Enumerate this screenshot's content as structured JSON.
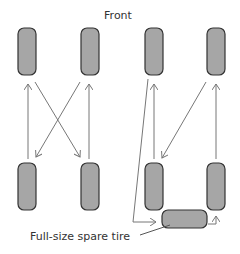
{
  "title": "Front",
  "spare_label": "Full-size spare tire",
  "colors": {
    "tire_fill": "#a6a6a6",
    "tire_stroke": "#333333",
    "arrow": "#777777",
    "text": "#333333"
  },
  "diagrams": [
    {
      "name": "four-tire-cross-rotation",
      "tires": [
        "front-left",
        "front-right",
        "rear-left",
        "rear-right"
      ],
      "moves": [
        {
          "from": "rear-left",
          "to": "front-left"
        },
        {
          "from": "rear-right",
          "to": "front-right"
        },
        {
          "from": "front-left",
          "to": "rear-right"
        },
        {
          "from": "front-right",
          "to": "rear-left"
        }
      ]
    },
    {
      "name": "five-tire-rotation-with-spare",
      "tires": [
        "front-left",
        "front-right",
        "rear-left",
        "rear-right",
        "spare"
      ],
      "moves": [
        {
          "from": "rear-left",
          "to": "front-left"
        },
        {
          "from": "rear-right",
          "to": "front-right"
        },
        {
          "from": "front-right",
          "to": "rear-left"
        },
        {
          "from": "front-left",
          "to": "spare"
        },
        {
          "from": "spare",
          "to": "rear-right"
        }
      ]
    }
  ]
}
